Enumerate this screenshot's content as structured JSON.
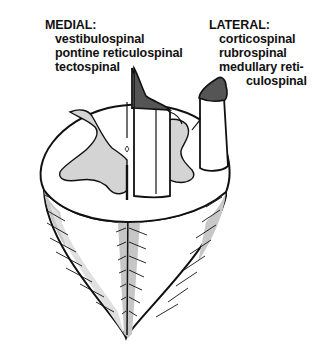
{
  "figure": {
    "colors": {
      "outline": "#111111",
      "gray_matter": "#d4d4d4",
      "tract_cap": "#555555",
      "white_matter": "#ffffff",
      "shading": "#bdbdbd"
    }
  },
  "medial": {
    "heading": "MEDIAL:",
    "items": [
      "vestibulospinal",
      "pontine reticulospinal",
      "tectospinal"
    ]
  },
  "lateral": {
    "heading": "LATERAL:",
    "items": [
      "corticospinal",
      "rubrospinal",
      "medullary reti-",
      "culospinal"
    ]
  }
}
